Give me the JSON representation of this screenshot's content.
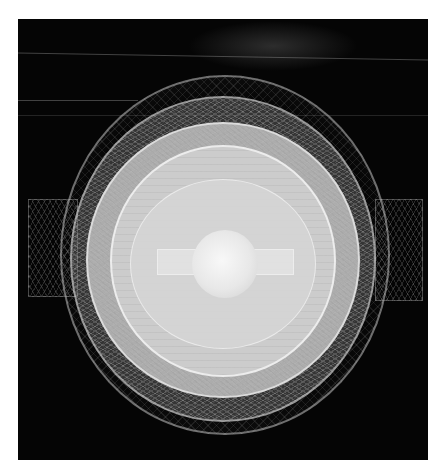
{
  "image": {
    "description": "Abstract nested spherical wireframe render on black background with bright central sphere and horizontal bar",
    "colors": {
      "background": "#050505",
      "outer_wire": "#8a8a8a",
      "inner_disc": "#d8d8d8",
      "core": "#f4f4f4"
    }
  }
}
